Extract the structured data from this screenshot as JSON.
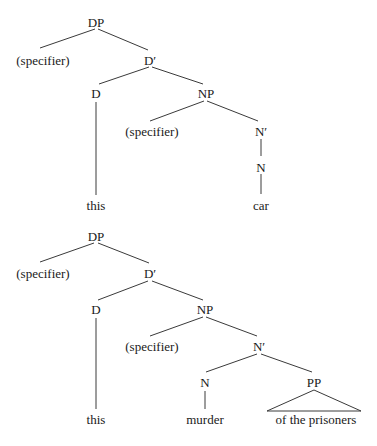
{
  "trees": [
    {
      "id": "tree-this-car",
      "nodes": {
        "dp": {
          "label": "DP",
          "x": 96,
          "y": 23
        },
        "dp_spec": {
          "label": "(specifier)",
          "x": 43,
          "y": 61
        },
        "d_bar": {
          "label": "D′",
          "x": 150,
          "y": 61
        },
        "d": {
          "label": "D",
          "x": 96,
          "y": 94
        },
        "np": {
          "label": "NP",
          "x": 206,
          "y": 94
        },
        "np_spec": {
          "label": "(specifier)",
          "x": 152,
          "y": 132
        },
        "n_bar": {
          "label": "N′",
          "x": 261,
          "y": 132
        },
        "n": {
          "label": "N",
          "x": 261,
          "y": 168
        },
        "word_d": {
          "label": "this",
          "x": 96,
          "y": 206
        },
        "word_n": {
          "label": "car",
          "x": 261,
          "y": 206
        }
      }
    },
    {
      "id": "tree-this-murder",
      "nodes": {
        "dp": {
          "label": "DP",
          "x": 96,
          "y": 237
        },
        "dp_spec": {
          "label": "(specifier)",
          "x": 43,
          "y": 274
        },
        "d_bar": {
          "label": "D′",
          "x": 150,
          "y": 274
        },
        "d": {
          "label": "D",
          "x": 96,
          "y": 310
        },
        "np": {
          "label": "NP",
          "x": 205,
          "y": 310
        },
        "np_spec": {
          "label": "(specifier)",
          "x": 152,
          "y": 347
        },
        "n_bar": {
          "label": "N′",
          "x": 259,
          "y": 347
        },
        "n": {
          "label": "N",
          "x": 205,
          "y": 383
        },
        "pp": {
          "label": "PP",
          "x": 314,
          "y": 383
        },
        "word_d": {
          "label": "this",
          "x": 96,
          "y": 420
        },
        "word_n": {
          "label": "murder",
          "x": 205,
          "y": 420
        },
        "word_pp": {
          "label": "of the prisoners",
          "x": 316,
          "y": 420
        }
      }
    }
  ]
}
